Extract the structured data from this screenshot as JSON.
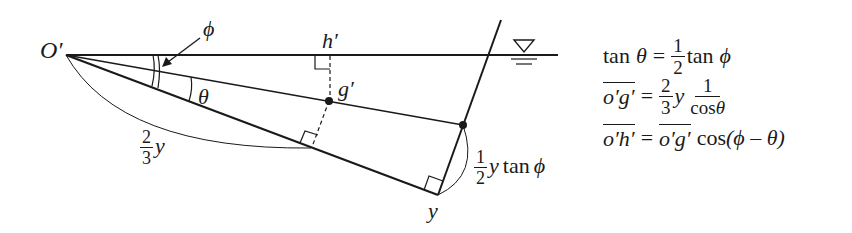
{
  "diagram": {
    "type": "geometry-figure",
    "labels": {
      "origin": "O′",
      "phi": "ϕ",
      "theta": "θ",
      "h_prime": "h′",
      "g_prime": "g′",
      "y_bottom": "y",
      "two_thirds_y": {
        "num": "2",
        "den": "3",
        "var": "y"
      },
      "half_y_tan_phi": {
        "num": "1",
        "den": "2",
        "var": "y",
        "func": "tan",
        "arg": "ϕ"
      }
    },
    "symbols": {
      "water_surface": "water-level-triangle"
    },
    "colors": {
      "stroke": "#1a1a1a",
      "background": "#ffffff"
    }
  },
  "equations": [
    {
      "lhs_func": "tan",
      "lhs_arg": "θ",
      "eq": "=",
      "frac_num": "1",
      "frac_den": "2",
      "rhs_func": "tan",
      "rhs_arg": "ϕ"
    },
    {
      "lhs_overline": "o′g′",
      "eq": "=",
      "frac_num": "2",
      "frac_den": "3",
      "var": "y",
      "frac2_num": "1",
      "frac2_den_func": "cos",
      "frac2_den_arg": "θ"
    },
    {
      "lhs_overline": "o′h′",
      "eq": "=",
      "rhs_overline": "o′g′",
      "rhs_func": "cos",
      "rhs_arg": "(ϕ – θ)"
    }
  ]
}
